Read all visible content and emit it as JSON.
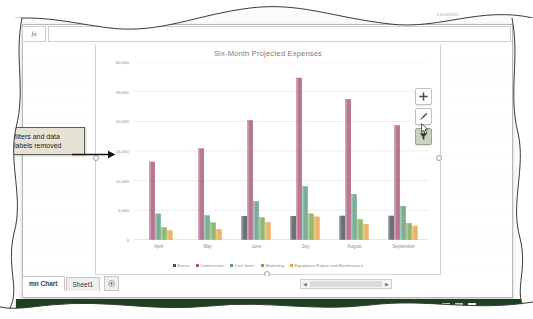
{
  "window": {
    "ribbon_ghost_text": "Location",
    "name_box_value": "",
    "fx_label": "fx",
    "formula_value": ""
  },
  "callout": {
    "text": "filters and data labels removed"
  },
  "chart_buttons": [
    {
      "name": "chart-elements-button",
      "icon": "plus-icon",
      "label": "+",
      "active": false
    },
    {
      "name": "chart-styles-button",
      "icon": "paintbrush-icon",
      "label": "",
      "active": false
    },
    {
      "name": "chart-filters-button",
      "icon": "funnel-icon",
      "label": "",
      "active": true
    }
  ],
  "sheet_tabs": [
    {
      "label": "mn Chart",
      "active": true
    },
    {
      "label": "Sheet1",
      "active": false
    }
  ],
  "add_sheet_label": "+",
  "scrollbar": {
    "left_arrow": "◀",
    "right_arrow": "▶"
  },
  "statusbar": {
    "view_buttons": [
      "normal-view",
      "page-layout-view",
      "page-break-view"
    ],
    "zoom_minus": "−",
    "zoom_plus": "+",
    "zoom_percent": "100%"
  },
  "chart_data": {
    "type": "bar",
    "title": "Six-Month Projected Expenses",
    "xlabel": "",
    "ylabel": "",
    "ylim": [
      0,
      30000
    ],
    "ytick_values": [
      0,
      5000,
      10000,
      15000,
      20000,
      25000,
      30000
    ],
    "ytick_labels": [
      "0",
      "5,000",
      "10,000",
      "15,000",
      "20,000",
      "25,000",
      "30,000"
    ],
    "grid": true,
    "legend_position": "bottom",
    "categories": [
      "April",
      "May",
      "June",
      "July",
      "August",
      "September"
    ],
    "series": [
      {
        "name": "Bonus",
        "color": "#4b4f56",
        "values": [
          0,
          0,
          4000,
          4000,
          4050,
          4050
        ]
      },
      {
        "name": "Commission",
        "color": "#a8577a",
        "values": [
          13150,
          15400,
          20150,
          27300,
          23700,
          19300
        ]
      },
      {
        "name": "Cost Items",
        "color": "#5d9e7e",
        "values": [
          4400,
          4100,
          6500,
          9000,
          7700,
          5700
        ]
      },
      {
        "name": "Marketing",
        "color": "#7aa84f",
        "values": [
          2100,
          2900,
          3750,
          4400,
          3450,
          2800
        ]
      },
      {
        "name": "Equipment Repair and Maintenance",
        "color": "#e8a44b",
        "values": [
          1600,
          1800,
          2950,
          3900,
          2650,
          2350
        ]
      }
    ]
  }
}
